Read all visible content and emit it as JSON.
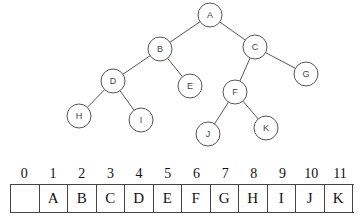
{
  "tree": {
    "nodes": [
      {
        "id": "A",
        "x": 210,
        "y": 15
      },
      {
        "id": "B",
        "x": 160,
        "y": 49
      },
      {
        "id": "C",
        "x": 255,
        "y": 47
      },
      {
        "id": "D",
        "x": 113,
        "y": 81
      },
      {
        "id": "E",
        "x": 190,
        "y": 86
      },
      {
        "id": "F",
        "x": 235,
        "y": 92
      },
      {
        "id": "G",
        "x": 306,
        "y": 74
      },
      {
        "id": "H",
        "x": 79,
        "y": 116
      },
      {
        "id": "I",
        "x": 141,
        "y": 120
      },
      {
        "id": "J",
        "x": 208,
        "y": 134
      },
      {
        "id": "K",
        "x": 266,
        "y": 128
      }
    ],
    "edges": [
      [
        "A",
        "B"
      ],
      [
        "A",
        "C"
      ],
      [
        "B",
        "D"
      ],
      [
        "B",
        "E"
      ],
      [
        "C",
        "F"
      ],
      [
        "C",
        "G"
      ],
      [
        "D",
        "H"
      ],
      [
        "D",
        "I"
      ],
      [
        "F",
        "J"
      ],
      [
        "F",
        "K"
      ]
    ]
  },
  "array": {
    "indices": [
      "0",
      "1",
      "2",
      "3",
      "4",
      "5",
      "6",
      "7",
      "8",
      "9",
      "10",
      "11"
    ],
    "values": [
      "",
      "A",
      "B",
      "C",
      "D",
      "E",
      "F",
      "G",
      "H",
      "I",
      "J",
      "K"
    ]
  }
}
